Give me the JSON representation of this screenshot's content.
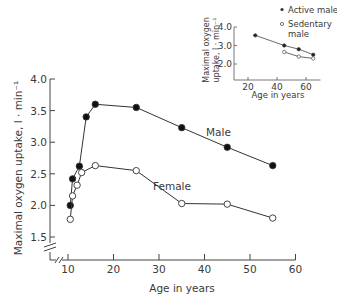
{
  "chart_data": [
    {
      "type": "line",
      "title": "",
      "xlabel": "Age in years",
      "ylabel": "Maximal oxygen uptake, l · min⁻¹",
      "xlim": [
        10,
        60
      ],
      "ylim": [
        1.5,
        4.0
      ],
      "axis_break": true,
      "grid": false,
      "x_ticks": [
        10,
        20,
        30,
        40,
        50,
        60
      ],
      "x_tick_labels": [
        "10",
        "20",
        "30",
        "40",
        "50",
        "60"
      ],
      "y_ticks": [
        1.5,
        2.0,
        2.5,
        3.0,
        3.5,
        4.0
      ],
      "y_tick_labels": [
        "1.5",
        "2.0",
        "2.5",
        "3.0",
        "3.5",
        "4.0"
      ],
      "series": [
        {
          "name": "Male",
          "marker": "filled-circle",
          "x": [
            10.5,
            11,
            12.5,
            14,
            16,
            25,
            35,
            45,
            55
          ],
          "y": [
            2.0,
            2.42,
            2.62,
            3.4,
            3.6,
            3.55,
            3.23,
            2.92,
            2.63
          ]
        },
        {
          "name": "Female",
          "marker": "open-circle",
          "x": [
            10.5,
            11,
            12,
            13,
            16,
            25,
            35,
            45,
            55
          ],
          "y": [
            1.78,
            2.15,
            2.32,
            2.52,
            2.63,
            2.55,
            2.03,
            2.02,
            1.8
          ]
        }
      ],
      "annotations": [
        "Male",
        "Female"
      ]
    },
    {
      "type": "line",
      "title": "",
      "xlabel": "Age in years",
      "ylabel": "Maximal oxygen uptake, l · min⁻¹",
      "xlim": [
        15,
        70
      ],
      "ylim": [
        1.5,
        4.2
      ],
      "grid": false,
      "x_ticks": [
        20,
        40,
        60
      ],
      "x_tick_labels": [
        "20",
        "40",
        "60"
      ],
      "y_ticks": [
        2.0,
        3.0,
        4.0
      ],
      "y_tick_labels": [
        "2.0",
        "3.0",
        "4.0"
      ],
      "legend_position": "top-right",
      "series": [
        {
          "name": "Active male",
          "marker": "filled-circle",
          "x": [
            25,
            45,
            55,
            65
          ],
          "y": [
            3.55,
            3.0,
            2.8,
            2.5
          ]
        },
        {
          "name": "Sedentary male",
          "marker": "open-circle",
          "x": [
            45,
            55,
            65
          ],
          "y": [
            2.65,
            2.4,
            2.3
          ]
        }
      ]
    }
  ],
  "legend": {
    "active": "Active male",
    "sedentary_line1": "Sedentary",
    "sedentary_line2": "male"
  },
  "main": {
    "ylabel": "Maximal oxygen uptake, l · min⁻¹",
    "xlabel": "Age in years",
    "male_label": "Male",
    "female_label": "Female"
  },
  "inset": {
    "ylabel_line1": "Maximal oxygen",
    "ylabel_line2": "uptake, l · min⁻¹",
    "xlabel": "Age in years"
  }
}
